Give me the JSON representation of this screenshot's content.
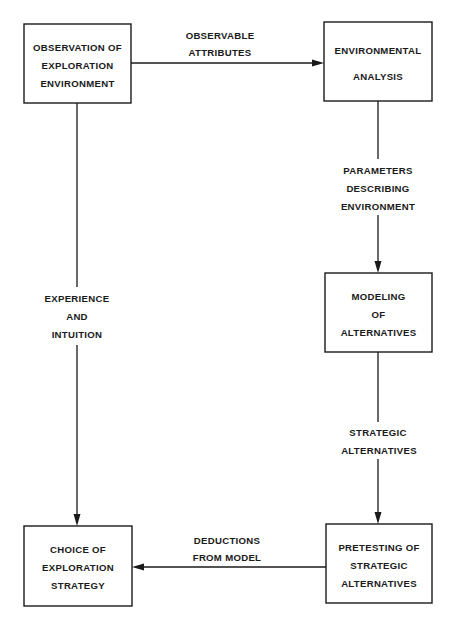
{
  "diagram": {
    "type": "flowchart",
    "background": "#ffffff",
    "line_color": "#1a1a1a",
    "nodes": [
      {
        "id": "observation",
        "lines": [
          "OBSERVATION OF",
          "EXPLORATION",
          "ENVIRONMENT"
        ]
      },
      {
        "id": "analysis",
        "lines": [
          "ENVIRONMENTAL",
          "ANALYSIS"
        ]
      },
      {
        "id": "modeling",
        "lines": [
          "MODELING",
          "OF",
          "ALTERNATIVES"
        ]
      },
      {
        "id": "pretesting",
        "lines": [
          "PRETESTING OF",
          "STRATEGIC",
          "ALTERNATIVES"
        ]
      },
      {
        "id": "choice",
        "lines": [
          "CHOICE OF",
          "EXPLORATION",
          "STRATEGY"
        ]
      }
    ],
    "edges": [
      {
        "from": "observation",
        "to": "analysis",
        "label_lines": [
          "OBSERVABLE",
          "ATTRIBUTES"
        ]
      },
      {
        "from": "analysis",
        "to": "modeling",
        "label_lines": [
          "PARAMETERS",
          "DESCRIBING",
          "ENVIRONMENT"
        ]
      },
      {
        "from": "modeling",
        "to": "pretesting",
        "label_lines": [
          "STRATEGIC",
          "ALTERNATIVES"
        ]
      },
      {
        "from": "pretesting",
        "to": "choice",
        "label_lines": [
          "DEDUCTIONS",
          "FROM MODEL"
        ]
      },
      {
        "from": "observation",
        "to": "choice",
        "label_lines": [
          "EXPERIENCE",
          "AND",
          "INTUITION"
        ]
      }
    ]
  }
}
